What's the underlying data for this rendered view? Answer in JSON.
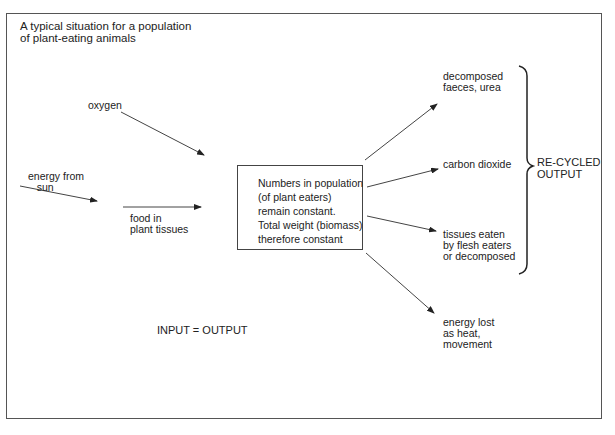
{
  "title": "A typical situation for a population\nof plant-eating animals",
  "inputs": {
    "oxygen": "oxygen",
    "energy_from_sun": "energy from\n   sun",
    "food": "food in\nplant tissues"
  },
  "central_box": "Numbers in population\n(of plant eaters)\nremain constant.\nTotal weight (biomass)\ntherefore constant",
  "outputs": {
    "decomposed": "decomposed\nfaeces, urea",
    "carbon_dioxide": "carbon dioxide",
    "tissues": "tissues eaten\nby flesh eaters\nor decomposed",
    "energy_lost": "energy lost\nas heat,\nmovement"
  },
  "recycled_label": "RE-CYCLED\nOUTPUT",
  "equation": "INPUT = OUTPUT",
  "colors": {
    "line": "#444444",
    "text": "#222222",
    "background": "#ffffff"
  }
}
